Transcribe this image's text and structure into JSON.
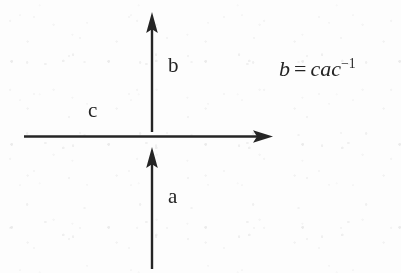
{
  "figure": {
    "kind": "math-diagram",
    "caption_text": "",
    "background_color": "#fdfdfd",
    "ink_color": "#252525"
  },
  "labels": {
    "up_top": "b",
    "horizontal": "c",
    "up_bottom": "a"
  },
  "equation": {
    "lhs": "b",
    "operator": "=",
    "rhs_base": "cac",
    "rhs_exponent": "−1",
    "full_text": "b = cac−1"
  },
  "arrows": [
    {
      "name": "arrow-up-top",
      "direction": "up",
      "label": "b",
      "x": 152,
      "y_start": 132,
      "y_end": 13
    },
    {
      "name": "arrow-horizontal",
      "direction": "right",
      "label": "c",
      "y": 136,
      "x_start": 24,
      "x_end": 272
    },
    {
      "name": "arrow-up-bottom",
      "direction": "up",
      "label": "a",
      "x": 152,
      "y_start": 268,
      "y_end": 148
    }
  ]
}
